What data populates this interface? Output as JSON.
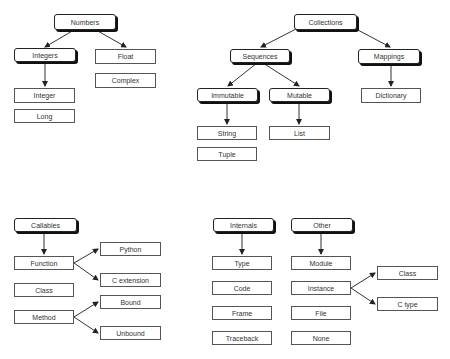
{
  "diagram": {
    "nodes": {
      "numbers": "Numbers",
      "integers": "Integers",
      "float": "Float",
      "complex": "Complex",
      "integer": "Integer",
      "long": "Long",
      "collections": "Collections",
      "sequences": "Sequences",
      "mappings": "Mappings",
      "immutable": "Immutable",
      "mutable": "Mutable",
      "dictionary": "Dictionary",
      "string": "String",
      "tuple": "Tuple",
      "list": "List",
      "callables": "Callables",
      "function": "Function",
      "class": "Class",
      "method": "Method",
      "python": "Python",
      "c_extension": "C extension",
      "bound": "Bound",
      "unbound": "Unbound",
      "internals": "Internals",
      "type": "Type",
      "code": "Code",
      "frame": "Frame",
      "traceback": "Traceback",
      "other": "Other",
      "module": "Module",
      "instance": "Instance",
      "file": "File",
      "none": "None",
      "instance_class": "Class",
      "c_type": "C type"
    },
    "edges": [
      [
        "Numbers",
        "Integers"
      ],
      [
        "Numbers",
        "Float"
      ],
      [
        "Integers",
        "Integer"
      ],
      [
        "Collections",
        "Sequences"
      ],
      [
        "Collections",
        "Mappings"
      ],
      [
        "Sequences",
        "Immutable"
      ],
      [
        "Sequences",
        "Mutable"
      ],
      [
        "Immutable",
        "String"
      ],
      [
        "Mutable",
        "List"
      ],
      [
        "Mappings",
        "Dictionary"
      ],
      [
        "Callables",
        "Function"
      ],
      [
        "Function",
        "Python"
      ],
      [
        "Function",
        "C extension"
      ],
      [
        "Method",
        "Bound"
      ],
      [
        "Method",
        "Unbound"
      ],
      [
        "Internals",
        "Type"
      ],
      [
        "Other",
        "Module"
      ],
      [
        "Instance",
        "Class"
      ],
      [
        "Instance",
        "C type"
      ]
    ]
  }
}
